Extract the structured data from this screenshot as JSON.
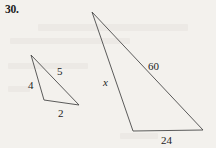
{
  "problem": {
    "number_label": "30."
  },
  "figure": {
    "background_color": "#f3f1ed",
    "stroke_color": "#4a4a4a",
    "text_color": "#1d1d1d"
  },
  "small_triangle": {
    "name": "small-triangle",
    "vertices": {
      "apex": [
        31,
        55
      ],
      "bottom_left": [
        44,
        100
      ],
      "bottom_right": [
        79,
        105
      ]
    },
    "labels": {
      "left_side": "4",
      "hypotenuse": "5",
      "base": "2"
    }
  },
  "large_triangle": {
    "name": "large-triangle",
    "vertices": {
      "apex": [
        92,
        12
      ],
      "bottom_left": [
        133,
        131
      ],
      "bottom_right": [
        203,
        130
      ]
    },
    "labels": {
      "left_side": "x",
      "hypotenuse": "60",
      "base": "24"
    }
  }
}
